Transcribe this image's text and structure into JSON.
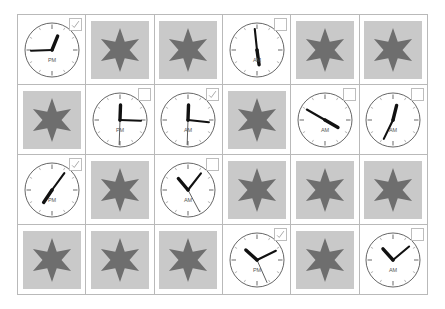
{
  "page": {
    "background_color": "#ffffff",
    "grid_line_color": "#b9b9b9",
    "star_fill_color": "#6e6e6e",
    "star_box_color": "#c9c9c9",
    "clock_face_color": "#ffffff",
    "clock_outline_color": "#555555",
    "hand_color": "#111111",
    "checkbox_border_color": "#bdbdbd",
    "check_mark_color": "#9a9a9a",
    "columns": 6,
    "rows": 4
  },
  "cells": [
    {
      "index": 1,
      "row": 1,
      "col": 1,
      "type": "clock",
      "meridiem": "PM",
      "hour_angle": 22,
      "minute_angle": 268,
      "second_angle": null,
      "checkbox": true
    },
    {
      "index": 2,
      "row": 1,
      "col": 2,
      "type": "star",
      "meridiem": null,
      "hour_angle": null,
      "minute_angle": null,
      "second_angle": null,
      "checkbox": null
    },
    {
      "index": 3,
      "row": 1,
      "col": 3,
      "type": "star",
      "meridiem": null,
      "hour_angle": null,
      "minute_angle": null,
      "second_angle": null,
      "checkbox": null
    },
    {
      "index": 4,
      "row": 1,
      "col": 4,
      "type": "clock",
      "meridiem": "AM",
      "hour_angle": 172,
      "minute_angle": 354,
      "second_angle": null,
      "checkbox": false
    },
    {
      "index": 5,
      "row": 1,
      "col": 5,
      "type": "star",
      "meridiem": null,
      "hour_angle": null,
      "minute_angle": null,
      "second_angle": null,
      "checkbox": null
    },
    {
      "index": 6,
      "row": 1,
      "col": 6,
      "type": "star",
      "meridiem": null,
      "hour_angle": null,
      "minute_angle": null,
      "second_angle": null,
      "checkbox": null
    },
    {
      "index": 7,
      "row": 2,
      "col": 1,
      "type": "star",
      "meridiem": null,
      "hour_angle": null,
      "minute_angle": null,
      "second_angle": null,
      "checkbox": null
    },
    {
      "index": 8,
      "row": 2,
      "col": 2,
      "type": "clock",
      "meridiem": "PM",
      "hour_angle": 2,
      "minute_angle": 92,
      "second_angle": 182,
      "checkbox": false
    },
    {
      "index": 9,
      "row": 2,
      "col": 3,
      "type": "clock",
      "meridiem": "AM",
      "hour_angle": 2,
      "minute_angle": 96,
      "second_angle": 182,
      "checkbox": true
    },
    {
      "index": 10,
      "row": 2,
      "col": 4,
      "type": "star",
      "meridiem": null,
      "hour_angle": null,
      "minute_angle": null,
      "second_angle": null,
      "checkbox": null
    },
    {
      "index": 11,
      "row": 2,
      "col": 5,
      "type": "clock",
      "meridiem": "AM",
      "hour_angle": 120,
      "minute_angle": 300,
      "second_angle": null,
      "checkbox": false
    },
    {
      "index": 12,
      "row": 2,
      "col": 6,
      "type": "clock",
      "meridiem": "AM",
      "hour_angle": 14,
      "minute_angle": 206,
      "second_angle": null,
      "checkbox": false
    },
    {
      "index": 13,
      "row": 3,
      "col": 1,
      "type": "clock",
      "meridiem": "PM",
      "hour_angle": 214,
      "minute_angle": 36,
      "second_angle": null,
      "checkbox": true
    },
    {
      "index": 14,
      "row": 3,
      "col": 2,
      "type": "star",
      "meridiem": null,
      "hour_angle": null,
      "minute_angle": null,
      "second_angle": null,
      "checkbox": null
    },
    {
      "index": 15,
      "row": 3,
      "col": 3,
      "type": "clock",
      "meridiem": "AM",
      "hour_angle": 320,
      "minute_angle": 38,
      "second_angle": 152,
      "checkbox": false
    },
    {
      "index": 16,
      "row": 3,
      "col": 4,
      "type": "star",
      "meridiem": null,
      "hour_angle": null,
      "minute_angle": null,
      "second_angle": null,
      "checkbox": null
    },
    {
      "index": 17,
      "row": 3,
      "col": 5,
      "type": "star",
      "meridiem": null,
      "hour_angle": null,
      "minute_angle": null,
      "second_angle": null,
      "checkbox": null
    },
    {
      "index": 18,
      "row": 3,
      "col": 6,
      "type": "star",
      "meridiem": null,
      "hour_angle": null,
      "minute_angle": null,
      "second_angle": null,
      "checkbox": null
    },
    {
      "index": 19,
      "row": 4,
      "col": 1,
      "type": "star",
      "meridiem": null,
      "hour_angle": null,
      "minute_angle": null,
      "second_angle": null,
      "checkbox": null
    },
    {
      "index": 20,
      "row": 4,
      "col": 2,
      "type": "star",
      "meridiem": null,
      "hour_angle": null,
      "minute_angle": null,
      "second_angle": null,
      "checkbox": null
    },
    {
      "index": 21,
      "row": 4,
      "col": 3,
      "type": "star",
      "meridiem": null,
      "hour_angle": null,
      "minute_angle": null,
      "second_angle": null,
      "checkbox": null
    },
    {
      "index": 22,
      "row": 4,
      "col": 4,
      "type": "clock",
      "meridiem": "PM",
      "hour_angle": 312,
      "minute_angle": 64,
      "second_angle": 156,
      "checkbox": true
    },
    {
      "index": 23,
      "row": 4,
      "col": 5,
      "type": "star",
      "meridiem": null,
      "hour_angle": null,
      "minute_angle": null,
      "second_angle": null,
      "checkbox": null
    },
    {
      "index": 24,
      "row": 4,
      "col": 6,
      "type": "clock",
      "meridiem": "AM",
      "hour_angle": 318,
      "minute_angle": 50,
      "second_angle": null,
      "checkbox": false
    }
  ]
}
